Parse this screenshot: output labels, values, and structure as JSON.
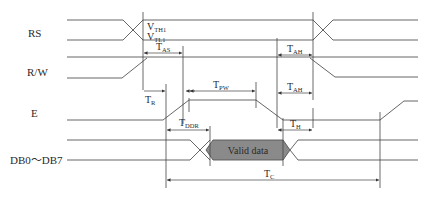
{
  "diagram": {
    "signals": [
      {
        "name": "RS"
      },
      {
        "name": "R/W"
      },
      {
        "name": "E"
      },
      {
        "name": "DB0～DB7"
      }
    ],
    "thresholds": {
      "vth_main": "V",
      "vth_sub": "TH1",
      "vtl_main": "V",
      "vtl_sub": "TL1"
    },
    "timings": {
      "tas": {
        "main": "T",
        "sub": "AS"
      },
      "tah_rw": {
        "main": "T",
        "sub": "AH"
      },
      "tah_e": {
        "main": "T",
        "sub": "AH"
      },
      "tpw": {
        "main": "T",
        "sub": "PW"
      },
      "tr": {
        "main": "T",
        "sub": "R"
      },
      "tddr": {
        "main": "T",
        "sub": "DDR"
      },
      "th": {
        "main": "T",
        "sub": "H"
      },
      "tc": {
        "main": "T",
        "sub": "C"
      }
    },
    "data_label": "Valid data",
    "colors": {
      "line": "#555555",
      "valid_data_fill": "#8a8a8a",
      "text": "#2a2a2a"
    }
  }
}
